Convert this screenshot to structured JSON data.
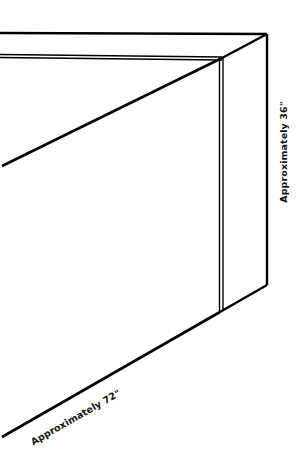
{
  "diagram": {
    "type": "dimension-drawing",
    "stroke_color": "#000000",
    "background_color": "#ffffff",
    "labels": {
      "height": "Approximately 36\"",
      "length": "Approximately 72\""
    }
  }
}
